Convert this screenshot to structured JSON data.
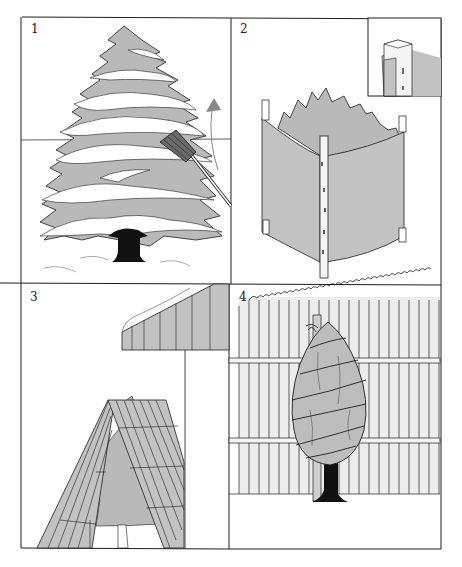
{
  "figure": {
    "colors": {
      "line": "#1e1e1e",
      "foliage_gray": "#b9b9b9",
      "burlap_gray": "#c2c2c2",
      "fence_light": "#ededed",
      "trunk": "#111111",
      "paper": "#ffffff"
    },
    "panels": [
      {
        "number": "1",
        "subject": "Snow-laden spruce tree being brushed off with a broom, upward arrow"
      },
      {
        "number": "2",
        "subject": "Shrub enclosed by burlap screen stapled to four wooden stakes, with corner detail inset"
      },
      {
        "number": "3",
        "subject": "Wooden A-frame slat shelter over small evergreen beneath a roof eave"
      },
      {
        "number": "4",
        "subject": "Tree wrapped in burlap and tied with twine to a stake in front of a picket fence"
      }
    ]
  }
}
